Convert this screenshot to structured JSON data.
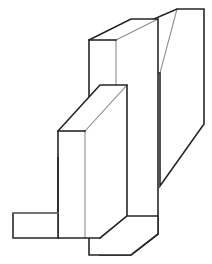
{
  "figure": {
    "background_color": "#ffffff",
    "stroke_color": "#262626",
    "soft_stroke_color": "#8e8e8e",
    "fill_color": "#ffffff",
    "canvas": {
      "width": 212,
      "height": 264
    },
    "projection": "isometric",
    "line_weight_px": 1.6,
    "soft_line_weight_px": 1.1
  },
  "geometry": {
    "back_plate": {
      "name": "back-plate",
      "description": "Tall rear slab receding up and to the right",
      "outline": "177,9 204,9 204,124 160,186 160,73 133,73 133,28",
      "top_face": "177,9 204,9 160,73 133,73",
      "soft_diagonal": "177,9 160,73"
    },
    "front_slab": {
      "name": "front-slab",
      "description": "Vertical front plate with visible top face",
      "outline": "89,40 131,19 158,19 158,234 131,255 89,255",
      "top_face": "89,40 131,19 158,19 116,40",
      "front_face": "89,40 116,40 116,255 89,255",
      "side_face": "116,40 158,19 158,234 116,255",
      "soft_edges": [
        "116,40 158,19",
        "116,40 116,255"
      ]
    },
    "rib": {
      "name": "triangular-rib-gusset",
      "description": "Angled rib plate with top face joining front slab to foot",
      "outline": "58,131 100,85 127,85 127,216 100,238 58,238",
      "top_face": "58,131 100,85 127,85 85,131",
      "front_face": "58,131 85,131 85,238 58,238",
      "soft_edges": [
        "85,131 127,85",
        "85,131 85,238"
      ]
    },
    "foot": {
      "name": "base-foot-triangle",
      "description": "Triangular web sloping from the rib down to the left foot pad",
      "outline": "58,157 58,213 13,213 13,238 58,238",
      "hypotenuse": "58,157 13,213",
      "soft_edge": "13,213 58,213"
    },
    "lower_step": {
      "name": "lower-step",
      "description": "Step where the rib foot meets the front slab base",
      "outline": "100,238 127,216 158,216 158,234 131,255 100,255"
    }
  },
  "rendering_notes": {
    "style": "white-filled faces with dark outlines, no shading or hatching",
    "annotations": "none",
    "dimensions_shown": "none",
    "text_labels": "none"
  }
}
